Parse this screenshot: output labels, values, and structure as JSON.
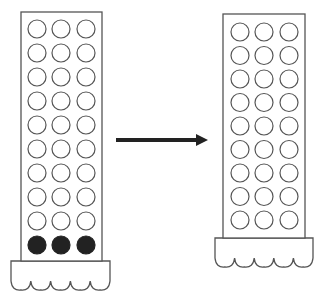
{
  "diagram": {
    "colors": {
      "stroke": "#555555",
      "filled": "#222222",
      "arrow": "#222222",
      "background": "#ffffff"
    },
    "left_rack": {
      "columns": 3,
      "rows": 10,
      "empty_rows": 9,
      "filled_rows": 1,
      "filled_row_position": "bottom",
      "rect": {
        "x": 21,
        "y": 12,
        "w": 81,
        "h": 249
      },
      "first_row_cy": 29,
      "row_spacing": 24,
      "col_cx": [
        37,
        61,
        86
      ],
      "circle_r": 9,
      "base": {
        "x": 11,
        "y": 261,
        "w": 99,
        "side_h": 20,
        "waves": 5,
        "wave_depth": 10
      }
    },
    "arrow": {
      "x1": 116,
      "y1": 140,
      "x2": 208,
      "y2": 140,
      "direction": "right"
    },
    "right_rack": {
      "columns": 3,
      "rows": 9,
      "empty_rows": 9,
      "filled_rows": 0,
      "rect": {
        "x": 223,
        "y": 14,
        "w": 82,
        "h": 224
      },
      "first_row_cy": 32,
      "row_spacing": 23.5,
      "col_cx": [
        240,
        264,
        289
      ],
      "circle_r": 9,
      "base": {
        "x": 215,
        "y": 238,
        "w": 98,
        "side_h": 20,
        "waves": 5,
        "wave_depth": 10
      }
    }
  }
}
